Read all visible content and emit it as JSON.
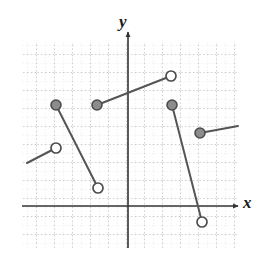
{
  "figure": {
    "kind": "piecewise-step-function-graph",
    "background": "#ffffff"
  },
  "axes": {
    "x_label": "x",
    "y_label": "y",
    "x_axis_pixel_y": 206,
    "y_axis_pixel_x": 128,
    "axis_color": "#333333",
    "grid_color": "#bdbdbd",
    "grid_major_color": "#9a9a9a",
    "grid_cell_px": 18,
    "grid_left": 22,
    "grid_top": 42,
    "grid_right": 238,
    "grid_bottom": 248,
    "tick_labels_visible": "none"
  },
  "chart_data": {
    "type": "line",
    "title": "",
    "xlabel": "x",
    "ylabel": "y",
    "grid": true,
    "legend": "none",
    "xlim": [
      -6,
      6
    ],
    "ylim": [
      -3,
      5
    ],
    "unit_px": 18,
    "note": "Piecewise (step-like) function drawn as four disjoint line segments with circular endpoint markers; filled circle = included endpoint, open circle = excluded endpoint.",
    "marker_styles": {
      "closed": {
        "fill": "#8c8c8c",
        "stroke": "#4d4d4d",
        "radius_px": 5
      },
      "open": {
        "fill": "#ffffff",
        "stroke": "#4d4d4d",
        "radius_px": 5
      }
    },
    "segment_color": "#555555",
    "segment_width_px": 2,
    "segments": [
      {
        "name": "segment-1",
        "start": {
          "px": [
            27,
            163
          ],
          "marker": "none",
          "arrow": false
        },
        "end": {
          "px": [
            56,
            148
          ],
          "marker": "open"
        },
        "slope_sign": "positive"
      },
      {
        "name": "segment-2",
        "start": {
          "px": [
            56,
            105
          ],
          "marker": "closed"
        },
        "end": {
          "px": [
            98,
            188
          ],
          "marker": "open"
        },
        "slope_sign": "negative"
      },
      {
        "name": "segment-3",
        "start": {
          "px": [
            97,
            105
          ],
          "marker": "closed"
        },
        "end": {
          "px": [
            171,
            76
          ],
          "marker": "open"
        },
        "slope_sign": "positive"
      },
      {
        "name": "segment-4",
        "start": {
          "px": [
            172,
            105
          ],
          "marker": "closed"
        },
        "end": {
          "px": [
            202,
            222
          ],
          "marker": "open"
        },
        "slope_sign": "negative"
      },
      {
        "name": "segment-5",
        "start": {
          "px": [
            200,
            133
          ],
          "marker": "closed"
        },
        "end": {
          "px": [
            238,
            126
          ],
          "marker": "none",
          "arrow": false
        },
        "slope_sign": "positive"
      }
    ],
    "points": [
      {
        "name": "open-endpoint-left",
        "px": [
          56,
          148
        ],
        "marker": "open"
      },
      {
        "name": "closed-endpoint-upper-left",
        "px": [
          56,
          105
        ],
        "marker": "closed"
      },
      {
        "name": "open-endpoint-lower-middle",
        "px": [
          98,
          188
        ],
        "marker": "open"
      },
      {
        "name": "closed-endpoint-middle",
        "px": [
          97,
          105
        ],
        "marker": "closed"
      },
      {
        "name": "open-endpoint-upper-right",
        "px": [
          171,
          76
        ],
        "marker": "open"
      },
      {
        "name": "closed-endpoint-right",
        "px": [
          172,
          105
        ],
        "marker": "closed"
      },
      {
        "name": "open-endpoint-bottom-right",
        "px": [
          202,
          222
        ],
        "marker": "open"
      },
      {
        "name": "closed-endpoint-far-right",
        "px": [
          200,
          133
        ],
        "marker": "closed"
      }
    ]
  }
}
